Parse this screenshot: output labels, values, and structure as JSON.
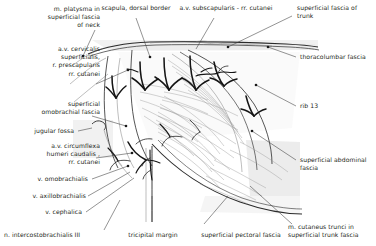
{
  "figure": {
    "type": "anatomical-illustration",
    "background_color": "#ffffff",
    "ink_color": "#231f20"
  },
  "labels": {
    "top_left": "m. platysma in\nsuperficial fascia\nof neck",
    "left_1": "a.v. cervicalis\nsuperficialis,\nr. prescapularis\nrr. cutanei",
    "left_2": "superficial\nomobrachial fascia",
    "left_3": "jugular fossa",
    "left_4": "a.v. circumflexa\nhumeri caudalis ,\nrr. cutanei",
    "left_5": "v. omobrachialis",
    "left_6": "v. axillobrachialis",
    "left_7": "v. cephalica",
    "bottom_left": "n. intercostobrachialis III",
    "top_center": "scapula, dorsal border",
    "top_center_2": "a.v. subscapularis - rr. cutanei",
    "top_right": "superficial fascia  of\ntrunk",
    "right_1": "thoracolumbar fascia",
    "right_2": "rib 13",
    "right_3": "superficial abdominal\nfascia",
    "bottom_center": "tricipital margin",
    "bottom_center_2": "superficial pectoral fascia",
    "bottom_right": "m. cutaneus trunci in\nsuperficial trunk fascia"
  }
}
